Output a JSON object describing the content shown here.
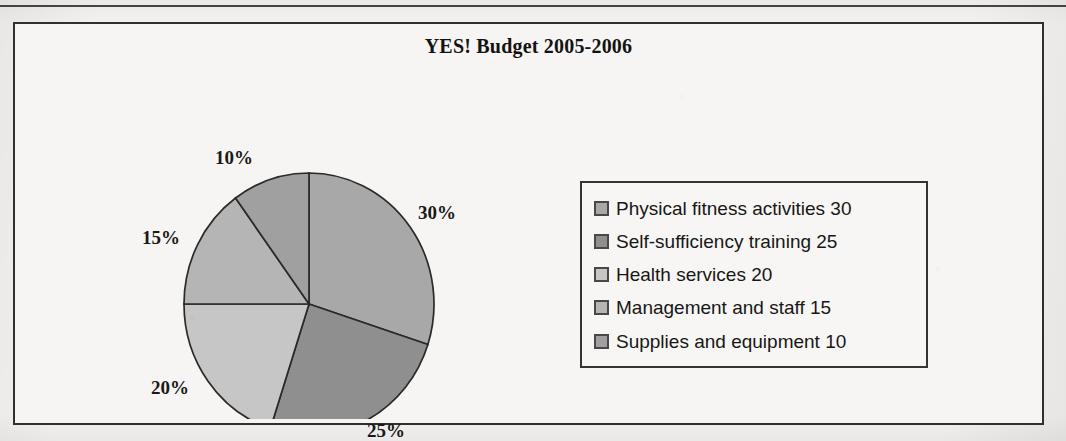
{
  "figure": {
    "title": "YES! Budget 2005-2006"
  },
  "chart_data": {
    "type": "pie",
    "title": "YES! Budget 2005-2006",
    "xlabel": "",
    "ylabel": "",
    "legend_position": "right",
    "grid": false,
    "start_angle_deg": 0,
    "direction": "clockwise",
    "categories": [
      "Physical fitness activities",
      "Self-sufficiency training",
      "Health services",
      "Management and staff",
      "Supplies and equipment"
    ],
    "values": [
      30,
      25,
      20,
      15,
      10
    ],
    "value_labels": [
      "30%",
      "25%",
      "20%",
      "15%",
      "10%"
    ],
    "colors": [
      "#a8a8a8",
      "#8f8f8f",
      "#c6c6c6",
      "#b5b5b5",
      "#a0a0a0"
    ],
    "slices": [
      {
        "label": "Physical fitness activities",
        "value": 30,
        "pct_label": "30%",
        "color": "#a8a8a8"
      },
      {
        "label": "Self-sufficiency training",
        "value": 25,
        "pct_label": "25%",
        "color": "#8f8f8f"
      },
      {
        "label": "Health services",
        "value": 20,
        "pct_label": "20%",
        "color": "#c6c6c6"
      },
      {
        "label": "Management and staff",
        "value": 15,
        "pct_label": "15%",
        "color": "#b5b5b5"
      },
      {
        "label": "Supplies and equipment",
        "value": 10,
        "pct_label": "10%",
        "color": "#a0a0a0"
      }
    ],
    "legend_entries": [
      {
        "text": "Physical fitness activities 30",
        "color": "#a8a8a8"
      },
      {
        "text": "Self-sufficiency training 25",
        "color": "#8f8f8f"
      },
      {
        "text": "Health services 20",
        "color": "#c6c6c6"
      },
      {
        "text": "Management and staff 15",
        "color": "#b5b5b5"
      },
      {
        "text": "Supplies and equipment 10",
        "color": "#a0a0a0"
      }
    ]
  }
}
